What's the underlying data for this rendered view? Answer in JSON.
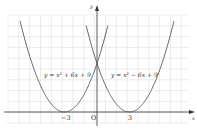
{
  "chart_data": {
    "type": "line",
    "title": "",
    "xlabel": "x",
    "ylabel": "y",
    "origin_label": "O",
    "x_ticks": [
      {
        "value": -3,
        "label": "−3"
      },
      {
        "value": 3,
        "label": "3"
      }
    ],
    "xlim": [
      -8.3,
      8.5
    ],
    "ylim": [
      -2,
      17
    ],
    "grid": true,
    "series": [
      {
        "name": "y = x² + 6x + 9",
        "label": "y = x² + 6x + 9",
        "formula": "x^2+6x+9",
        "x_range": [
          -7.1,
          1
        ],
        "vertex": [
          -3,
          0
        ],
        "y_intercept": 9
      },
      {
        "name": "y = x² − 6x + 9",
        "label": "y = x² − 6x + 9",
        "formula": "x^2-6x+9",
        "x_range": [
          -1,
          7.1
        ],
        "vertex": [
          3,
          0
        ],
        "y_intercept": 9
      }
    ],
    "colors": {
      "curve": "#555555",
      "grid": "#d9d9d9",
      "axis": "#333333"
    }
  }
}
